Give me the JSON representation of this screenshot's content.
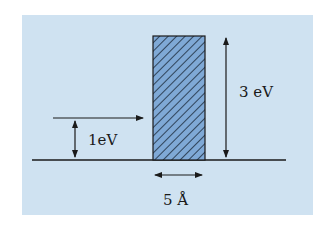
{
  "diagram": {
    "colors": {
      "background": "#cfe2f1",
      "barrier_fill": "#7fa9d6",
      "hatch": "#1b2a3a",
      "line": "#1a1a1a"
    },
    "labels": {
      "particle_energy": "1eV",
      "barrier_height": "3 eV",
      "barrier_width": "5 Å"
    },
    "quantities": {
      "particle_energy_eV": 1,
      "barrier_height_eV": 3,
      "barrier_width_angstrom": 5
    }
  }
}
